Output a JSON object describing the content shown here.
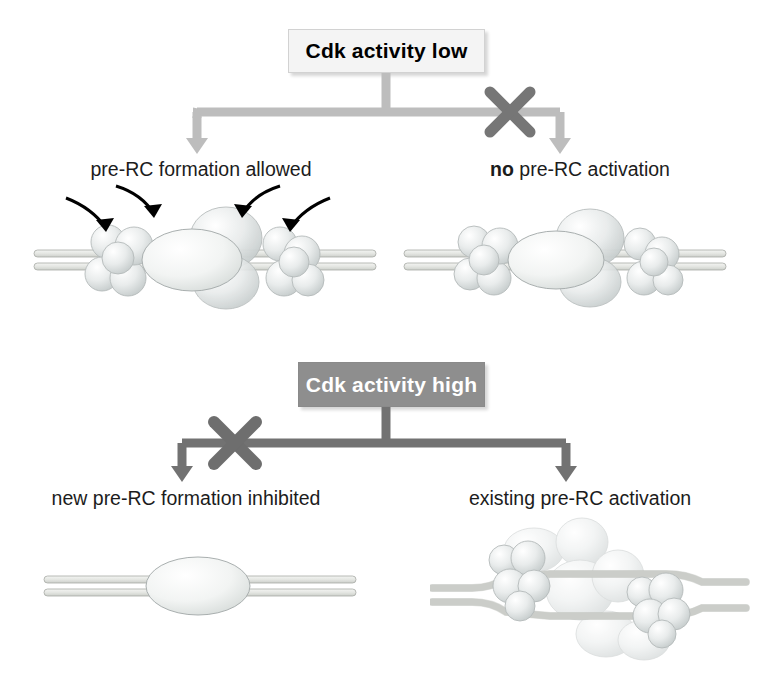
{
  "figure": {
    "background_color": "#ffffff"
  },
  "panels": {
    "top": {
      "box": {
        "label": "Cdk activity low",
        "fill_color": "#f4f4f4",
        "text_color": "#000000",
        "border_color": "#d2d2d2"
      },
      "branches": [
        {
          "name": "left-branch",
          "label_plain": "pre-RC formation allowed",
          "label_bold_prefix": "",
          "label_rest": "pre-RC formation allowed",
          "blocked": false,
          "arrow_color": "#bdbdbd"
        },
        {
          "name": "right-branch",
          "label_plain": "no pre-RC activation",
          "label_bold_prefix": "no",
          "label_rest": " pre-RC activation",
          "blocked": true,
          "arrow_color": "#bdbdbd",
          "block_marker_color": "#767676"
        }
      ]
    },
    "bottom": {
      "box": {
        "label": "Cdk activity high",
        "fill_color": "#8e8e8e",
        "text_color": "#ffffff",
        "border_color": "#8a8a8a"
      },
      "branches": [
        {
          "name": "left-branch",
          "label_plain": "new pre-RC formation inhibited",
          "label_bold_prefix": "",
          "label_rest": "new pre-RC formation inhibited",
          "blocked": true,
          "arrow_color": "#727272",
          "block_marker_color": "#6e6e6e"
        },
        {
          "name": "right-branch",
          "label_plain": "existing pre-RC activation",
          "label_bold_prefix": "",
          "label_rest": "existing pre-RC activation",
          "blocked": false,
          "arrow_color": "#727272"
        }
      ]
    }
  },
  "illustrations": {
    "top_left": {
      "name": "pre-RC loading complex with loading arrows",
      "dna": "double-strand",
      "origin_oval": "ORC",
      "sphere_clusters": 2,
      "loading_arrows": 4,
      "loading_arrow_color": "#000000"
    },
    "top_right": {
      "name": "assembled inactive pre-RC",
      "dna": "double-strand",
      "origin_oval": "ORC",
      "sphere_clusters": 2,
      "loading_arrows": 0
    },
    "bottom_left": {
      "name": "bare origin DNA with ORC only",
      "dna": "double-strand",
      "origin_oval": "ORC",
      "sphere_clusters": 0,
      "loading_arrows": 0
    },
    "bottom_right": {
      "name": "activated replication bubble with helicase complexes",
      "dna": "unwound-bubble",
      "origin_oval": "none",
      "sphere_clusters": 2,
      "loading_arrows": 0
    }
  },
  "colors": {
    "protein_fill_light": "#eceeee",
    "protein_fill_mid": "#dadedd",
    "protein_stroke": "#a9afaf",
    "dna_fill": "#e8e9e6",
    "dna_stroke": "#a7a9a4",
    "arrow_light": "#bdbdbd",
    "arrow_dark": "#727272",
    "block_x": "#6e6e6e"
  }
}
